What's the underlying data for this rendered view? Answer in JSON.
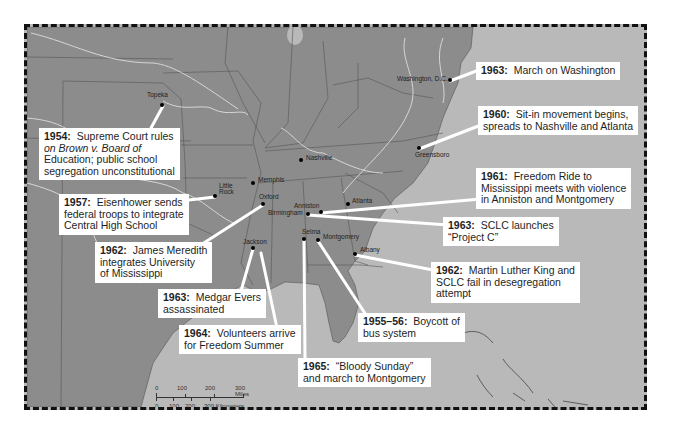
{
  "map": {
    "colors": {
      "land": "#8c8c8c",
      "water": "#b9b9b9",
      "rivers": "#d6d6d6",
      "borders": "#555555",
      "callout_bg": "#ffffff",
      "frame": "#111111"
    },
    "cities": [
      {
        "name": "Topeka",
        "x": 160,
        "y": 103
      },
      {
        "name": "Washington, D.C.",
        "x": 447,
        "y": 78
      },
      {
        "name": "Nashville",
        "x": 298,
        "y": 158
      },
      {
        "name": "Memphis",
        "x": 250,
        "y": 181
      },
      {
        "name": "Little Rock",
        "x": 212,
        "y": 194
      },
      {
        "name": "Oxford",
        "x": 260,
        "y": 202
      },
      {
        "name": "Anniston",
        "x": 318,
        "y": 210
      },
      {
        "name": "Birmingham",
        "x": 305,
        "y": 212
      },
      {
        "name": "Atlanta",
        "x": 345,
        "y": 202
      },
      {
        "name": "Greensboro",
        "x": 416,
        "y": 146
      },
      {
        "name": "Jackson",
        "x": 250,
        "y": 246
      },
      {
        "name": "Selma",
        "x": 301,
        "y": 237
      },
      {
        "name": "Montgomery",
        "x": 315,
        "y": 238
      },
      {
        "name": "Albany",
        "x": 352,
        "y": 252
      }
    ],
    "callouts": [
      {
        "year": "1954:",
        "lines": [
          "Supreme Court rules",
          "on Brown v. Board of",
          "Education; public school",
          "segregation unconstitutional"
        ]
      },
      {
        "year": "1957:",
        "lines": [
          "Eisenhower sends",
          "federal troops to integrate",
          "Central High School"
        ]
      },
      {
        "year": "1962:",
        "lines": [
          "James Meredith",
          "integrates University",
          "of Mississippi"
        ]
      },
      {
        "year": "1963:",
        "lines": [
          "Medgar Evers",
          "assassinated"
        ]
      },
      {
        "year": "1964:",
        "lines": [
          "Volunteers arrive",
          "for Freedom Summer"
        ]
      },
      {
        "year": "1965:",
        "lines": [
          "“Bloody Sunday”",
          "and march to Montgomery"
        ]
      },
      {
        "year": "1955–56:",
        "lines": [
          "Boycott of",
          "bus system"
        ]
      },
      {
        "year": "1962:",
        "lines": [
          "Martin Luther King and",
          "SCLC fail in desegregation",
          "attempt"
        ]
      },
      {
        "year": "1963:",
        "lines": [
          "SCLC launches",
          "“Project C”"
        ]
      },
      {
        "year": "1961:",
        "lines": [
          "Freedom Ride to",
          "Mississippi meets with violence",
          "in Anniston and Montgomery"
        ]
      },
      {
        "year": "1960:",
        "lines": [
          "Sit-in movement begins,",
          "spreads to Nashville and Atlanta"
        ]
      },
      {
        "year": "1963:",
        "lines": [
          "March on Washington"
        ]
      }
    ],
    "scale_bar": {
      "miles_ticks": [
        "0",
        "100",
        "200",
        "300 Miles"
      ],
      "km_ticks": [
        "0",
        "100",
        "200",
        "300 Kilometers"
      ]
    }
  }
}
